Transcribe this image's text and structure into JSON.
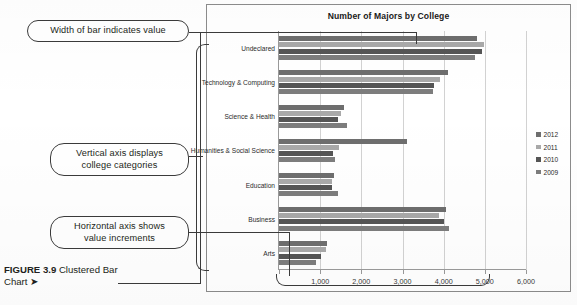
{
  "figure": {
    "number_label": "FIGURE 3.9",
    "caption_text": "Clustered Bar Chart",
    "arrow_glyph": "➤"
  },
  "callouts": [
    {
      "id": "width-of-bar",
      "text": "Width of bar indicates value"
    },
    {
      "id": "vertical-axis",
      "line1": "Vertical axis displays",
      "line2": "college categories"
    },
    {
      "id": "horizontal-axis",
      "line1": "Horizontal axis shows",
      "line2": "value increments"
    }
  ],
  "legend": {
    "position": "right",
    "entries": [
      {
        "label": "2012",
        "color": "#6e6e6e"
      },
      {
        "label": "2011",
        "color": "#a9a9a9"
      },
      {
        "label": "2010",
        "color": "#555555"
      },
      {
        "label": "2009",
        "color": "#7d7d7d"
      }
    ]
  },
  "chart_data": {
    "type": "bar",
    "orientation": "horizontal",
    "title": "Number of Majors by College",
    "xlabel": "",
    "ylabel": "",
    "xlim": [
      0,
      6000
    ],
    "xticks": [
      0,
      1000,
      2000,
      3000,
      4000,
      5000,
      6000
    ],
    "xtick_labels": [
      "",
      "1,000",
      "2,000",
      "3,000",
      "4,000",
      "5,000",
      "6,000"
    ],
    "grid": true,
    "legend_position": "right",
    "categories": [
      "Undeclared",
      "Technology & Computing",
      "Science & Health",
      "Humanities & Social Science",
      "Education",
      "Business",
      "Arts"
    ],
    "series": [
      {
        "name": "2012",
        "color": "#6e6e6e",
        "values": [
          4820,
          4100,
          1580,
          3120,
          1340,
          4050,
          1160
        ]
      },
      {
        "name": "2011",
        "color": "#a9a9a9",
        "values": [
          4990,
          3900,
          1510,
          1450,
          1290,
          3880,
          1140
        ]
      },
      {
        "name": "2010",
        "color": "#555555",
        "values": [
          4930,
          3760,
          1440,
          1300,
          1280,
          4020,
          1010
        ]
      },
      {
        "name": "2009",
        "color": "#7d7d7d",
        "values": [
          4760,
          3740,
          1660,
          1370,
          1440,
          4120,
          900
        ]
      }
    ]
  }
}
